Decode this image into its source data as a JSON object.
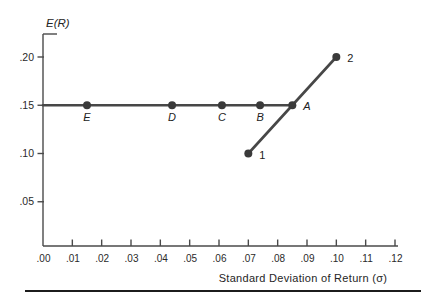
{
  "figure": {
    "background": "#ffffff",
    "rule_color": "#1c1c1c"
  },
  "chart_data": {
    "type": "line",
    "title": "",
    "xlabel": "Standard Deviation of Return (σ)",
    "ylabel": "E(R)",
    "xlim": [
      0,
      0.12
    ],
    "ylim": [
      0,
      0.225
    ],
    "grid": false,
    "legend": "none",
    "x_ticks": {
      "values": [
        0,
        0.01,
        0.02,
        0.03,
        0.04,
        0.05,
        0.06,
        0.07,
        0.08,
        0.09,
        0.1,
        0.11,
        0.12
      ],
      "labels": [
        ".00",
        ".01",
        ".02",
        ".03",
        ".04",
        ".05",
        ".06",
        ".07",
        ".08",
        ".09",
        ".10",
        ".11",
        ".12"
      ]
    },
    "y_ticks": {
      "values": [
        0.05,
        0.1,
        0.15,
        0.2
      ],
      "labels": [
        ".05",
        ".10",
        ".15",
        ".20"
      ]
    },
    "colors": {
      "line": "#474747",
      "point": "#3a3a3a",
      "text": "#222222",
      "axis": "#4a4a4a"
    },
    "series": [
      {
        "name": "equal-expected-return-portfolios",
        "line": {
          "from": {
            "x": 0.0,
            "y": 0.15
          },
          "to": {
            "x": 0.085,
            "y": 0.15
          }
        },
        "points": [
          {
            "x": 0.015,
            "y": 0.15,
            "label": "E",
            "label_pos": "below",
            "label_style": "italic"
          },
          {
            "x": 0.044,
            "y": 0.15,
            "label": "D",
            "label_pos": "below",
            "label_style": "italic"
          },
          {
            "x": 0.061,
            "y": 0.15,
            "label": "C",
            "label_pos": "below",
            "label_style": "italic"
          },
          {
            "x": 0.074,
            "y": 0.15,
            "label": "B",
            "label_pos": "below",
            "label_style": "italic"
          },
          {
            "x": 0.085,
            "y": 0.15,
            "label": "A",
            "label_pos": "right",
            "label_style": "italic"
          }
        ]
      },
      {
        "name": "asset-1-2-combination-line",
        "line": {
          "from": {
            "x": 0.07,
            "y": 0.1
          },
          "to": {
            "x": 0.1,
            "y": 0.2
          }
        },
        "points": [
          {
            "x": 0.07,
            "y": 0.1,
            "label": "1",
            "label_pos": "right",
            "label_style": "normal"
          },
          {
            "x": 0.1,
            "y": 0.2,
            "label": "2",
            "label_pos": "right",
            "label_style": "normal"
          }
        ]
      }
    ]
  }
}
